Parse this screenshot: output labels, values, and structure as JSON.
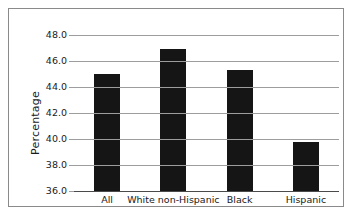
{
  "chart_data": {
    "type": "bar",
    "title": "",
    "subtitle": "",
    "xlabel": "",
    "ylabel": "Percentage",
    "categories": [
      "All",
      "White non-Hispanic",
      "Black",
      "Hispanic"
    ],
    "values": [
      45.0,
      46.9,
      45.3,
      39.8
    ],
    "ylim": [
      36.0,
      48.0
    ],
    "ytick_step": 2.0,
    "ytick_labels": [
      "48.0",
      "46.0",
      "44.0",
      "42.0",
      "40.0",
      "38.0",
      "36.0"
    ],
    "ytick_values": [
      48.0,
      46.0,
      44.0,
      42.0,
      40.0,
      38.0,
      36.0
    ],
    "grid": "horizontal",
    "legend": "none",
    "series": [
      {
        "name": "Percentage",
        "color": "#151515",
        "values": [
          45.0,
          46.9,
          45.3,
          39.8
        ]
      }
    ]
  },
  "figure": {
    "border_color": "#8a8a8a",
    "grid_color": "#9d9d9d",
    "bar_color": "#151515",
    "background": "#ffffff",
    "caption": ""
  }
}
